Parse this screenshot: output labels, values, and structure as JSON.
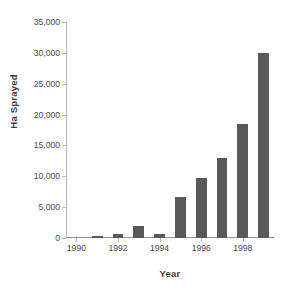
{
  "chart_data": {
    "type": "bar",
    "title": "",
    "subtitle": "",
    "xlabel": "Year",
    "ylabel": "Ha Sprayed",
    "categories": [
      1990,
      1991,
      1992,
      1993,
      1994,
      1995,
      1996,
      1997,
      1998,
      1999
    ],
    "values": [
      0,
      300,
      650,
      2000,
      650,
      6600,
      9800,
      12900,
      18500,
      30000
    ],
    "series": [
      {
        "name": "Ha Sprayed",
        "values": [
          0,
          300,
          650,
          2000,
          650,
          6600,
          9800,
          12900,
          18500,
          30000
        ]
      }
    ],
    "ylim": [
      0,
      35000
    ],
    "xlim": [
      1989.5,
      1999.5
    ],
    "y_ticks": [
      0,
      5000,
      10000,
      15000,
      20000,
      25000,
      30000,
      35000
    ],
    "y_tick_labels": [
      "0",
      "5,000",
      "10,000",
      "15,000",
      "20,000",
      "25,000",
      "30,000",
      "35,000"
    ],
    "x_ticks": [
      1990,
      1992,
      1994,
      1996,
      1998
    ],
    "x_tick_labels": [
      "1990",
      "1992",
      "1994",
      "1996",
      "1998"
    ],
    "grid": false,
    "legend": false,
    "legend_position": "none",
    "bar_color": "#595959",
    "axis_color": "#b9b9b9",
    "text_color": "#4a4a4a",
    "background_color": "#ffffff",
    "annotations": []
  }
}
